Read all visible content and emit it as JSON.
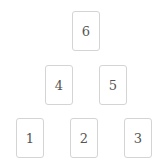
{
  "cards": [
    {
      "label": "1",
      "x": 16,
      "y": 118
    },
    {
      "label": "2",
      "x": 70,
      "y": 118
    },
    {
      "label": "3",
      "x": 124,
      "y": 118
    },
    {
      "label": "4",
      "x": 45,
      "y": 65
    },
    {
      "label": "5",
      "x": 99,
      "y": 65
    },
    {
      "label": "6",
      "x": 72,
      "y": 11
    }
  ]
}
